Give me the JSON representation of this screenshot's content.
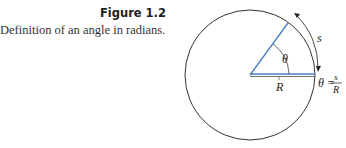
{
  "figure": {
    "label": "Figure 1.2",
    "caption": "Definition of an angle in radians."
  },
  "diagram": {
    "angle_symbol": "θ",
    "radius_label": "R",
    "arc_label": "s",
    "formula_lhs": "θ =",
    "formula_num": "s",
    "formula_den": "R",
    "colors": {
      "circle": "#333333",
      "radius_line": "#4a7fc1",
      "text": "#222222"
    }
  }
}
